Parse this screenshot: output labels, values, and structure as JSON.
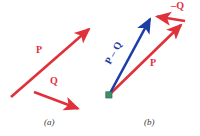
{
  "figure": {
    "type": "vector-diagram",
    "background": "#ffffff",
    "width": 200,
    "height": 136,
    "colors": {
      "red": "#e0313b",
      "blue": "#1d3da6",
      "origin_dot": "#3f8f6a",
      "caption": "#3a3a3a"
    }
  },
  "panel_a": {
    "caption": "(a)",
    "caption_pos": {
      "x": 44,
      "y": 121
    },
    "vectors": [
      {
        "name": "P",
        "label": "P",
        "color": "#e0313b",
        "x1": 11,
        "y1": 97,
        "x2": 92,
        "y2": 26,
        "label_pos": {
          "x": 36,
          "y": 50
        }
      },
      {
        "name": "Q",
        "label": "Q",
        "color": "#e0313b",
        "x1": 34,
        "y1": 92,
        "x2": 82,
        "y2": 110,
        "label_pos": {
          "x": 50,
          "y": 81
        }
      }
    ]
  },
  "panel_b": {
    "caption": "(b)",
    "caption_pos": {
      "x": 144,
      "y": 121
    },
    "origin": {
      "x": 109,
      "y": 95
    },
    "vectors": [
      {
        "name": "P-minus-Q",
        "label": "P – Q",
        "color": "#1d3da6",
        "x1": 109,
        "y1": 95,
        "x2": 152,
        "y2": 15,
        "label_pos": {
          "x": 114,
          "y": 62
        },
        "label_rotation_deg": -61
      },
      {
        "name": "P",
        "label": "P",
        "color": "#e0313b",
        "x1": 109,
        "y1": 95,
        "x2": 185,
        "y2": 21,
        "label_pos": {
          "x": 150,
          "y": 60
        }
      },
      {
        "name": "minus-Q",
        "label": "–Q",
        "color": "#e0313b",
        "x1": 185,
        "y1": 21,
        "x2": 153,
        "y2": 16,
        "label_pos": {
          "x": 172,
          "y": 2
        }
      }
    ]
  }
}
